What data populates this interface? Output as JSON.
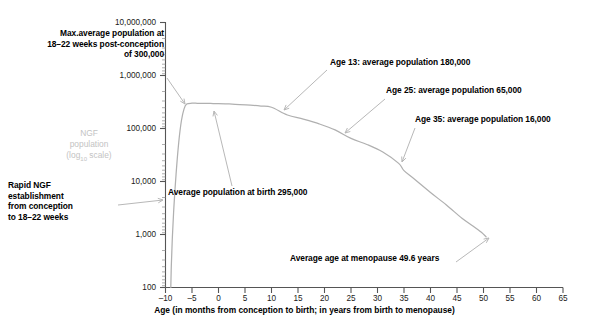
{
  "chart_data": {
    "type": "line",
    "title": "",
    "xlabel": "Age (in months from conception to birth; in years from birth to menopause)",
    "ylabel": "NGF population (log10 scale)",
    "ylabel_line1": "NGF",
    "ylabel_line2": "population",
    "ylabel_line3_pre": "(log",
    "ylabel_line3_sub": "10",
    "ylabel_line3_post": " scale)",
    "yscale": "log10",
    "xlim": [
      -10,
      65
    ],
    "ylim": [
      100,
      10000000
    ],
    "grid": false,
    "legend": false,
    "xticks": [
      -10,
      -5,
      0,
      5,
      10,
      15,
      20,
      25,
      30,
      35,
      40,
      45,
      50,
      55,
      60,
      65
    ],
    "xtick_labels": [
      "–10",
      "–5",
      "0",
      "5",
      "10",
      "15",
      "20",
      "25",
      "30",
      "35",
      "40",
      "45",
      "50",
      "55",
      "60",
      "65"
    ],
    "yticks": [
      100,
      1000,
      10000,
      100000,
      1000000,
      10000000
    ],
    "ytick_labels": [
      "100",
      "1,000",
      "10,000",
      "100,000",
      "1,000,000",
      "10,000,000"
    ],
    "series": [
      {
        "name": "Non-growing follicle (NGF) population",
        "color": "#b0b0b0",
        "x": [
          -9.0,
          -8.9,
          -8.7,
          -8.4,
          -8.0,
          -7.5,
          -7.0,
          -6.5,
          -6.0,
          -5.0,
          -4.0,
          -3.0,
          -2.0,
          -1.0,
          0.0,
          2.0,
          4.0,
          6.0,
          8.0,
          10.0,
          13.0,
          16.0,
          19.0,
          22.0,
          25.0,
          28.0,
          31.0,
          34.0,
          35.0,
          37.0,
          40.0,
          43.0,
          46.0,
          48.0,
          49.6,
          50.5
        ],
        "y": [
          100,
          260,
          900,
          3500,
          14000,
          55000,
          140000,
          235000,
          290000,
          300000,
          299000,
          298000,
          297000,
          296000,
          295000,
          290000,
          283000,
          275000,
          265000,
          252000,
          180000,
          150000,
          122000,
          94000,
          65000,
          50000,
          36000,
          22000,
          16000,
          11000,
          6200,
          3600,
          2000,
          1450,
          1100,
          900
        ]
      }
    ],
    "annotations": [
      {
        "id": "max-population",
        "text": "Max.average population at\n18–22 weeks post-conception\nof 300,000",
        "align": "right",
        "arrow_from": [
          167,
          78
        ],
        "arrow_to": [
          185,
          104
        ]
      },
      {
        "id": "rapid-establishment",
        "text": "Rapid NGF\nestablishment\nfrom conception\nto 18–22 weeks",
        "align": "left",
        "arrow_from": [
          118,
          205
        ],
        "arrow_to": [
          163,
          200
        ]
      },
      {
        "id": "population-at-birth",
        "text": "Average population at birth 295,000",
        "align": "left",
        "arrow_from": [
          232,
          186
        ],
        "arrow_to": [
          214,
          111
        ]
      },
      {
        "id": "age-13",
        "text": "Age 13: average population 180,000",
        "align": "left",
        "arrow_from": [
          327,
          70
        ],
        "arrow_to": [
          284,
          110
        ]
      },
      {
        "id": "age-25",
        "text": "Age 25: average population 65,000",
        "align": "left",
        "arrow_from": [
          385,
          99
        ],
        "arrow_to": [
          345,
          133
        ]
      },
      {
        "id": "age-35",
        "text": "Age 35: average population 16,000",
        "align": "left",
        "arrow_from": [
          415,
          128
        ],
        "arrow_to": [
          402,
          162
        ]
      },
      {
        "id": "menopause",
        "text": "Average age at menopause 49.6 years",
        "align": "left",
        "arrow_from": [
          456,
          262
        ],
        "arrow_to": [
          489,
          238
        ]
      }
    ]
  }
}
